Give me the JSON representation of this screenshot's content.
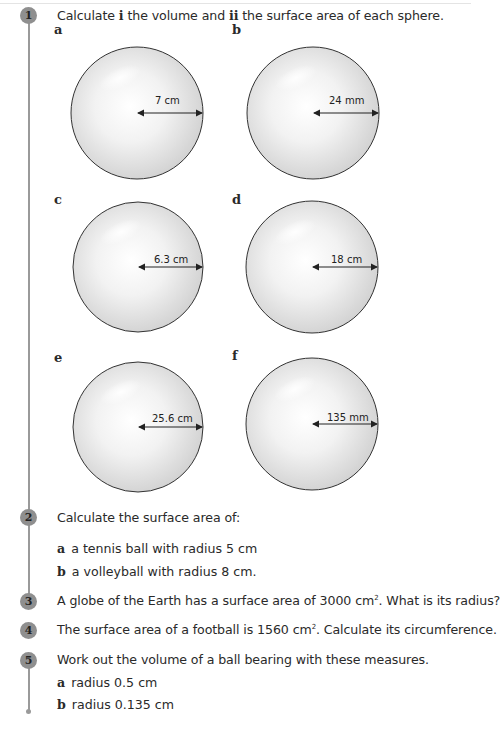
{
  "questions": [
    {
      "number": "1",
      "text_parts": [
        "Calculate ",
        "i",
        " the volume and ",
        "ii",
        " the surface area of each sphere."
      ],
      "spheres": [
        {
          "label": "a",
          "radius": "7 cm"
        },
        {
          "label": "b",
          "radius": "24 mm"
        },
        {
          "label": "c",
          "radius": "6.3 cm"
        },
        {
          "label": "d",
          "radius": "18 cm"
        },
        {
          "label": "e",
          "radius": "25.6 cm"
        },
        {
          "label": "f",
          "radius": "135 mm"
        }
      ]
    },
    {
      "number": "2",
      "text": "Calculate the surface area of:",
      "parts": [
        {
          "label": "a",
          "text": "a tennis ball with radius 5 cm"
        },
        {
          "label": "b",
          "text": "a volleyball with radius 8 cm."
        }
      ]
    },
    {
      "number": "3",
      "text_before": "A globe of the Earth has a surface area of 3000 cm",
      "sup": "2",
      "text_after": ". What is its radius?"
    },
    {
      "number": "4",
      "text_before": "The surface area of a football is 1560 cm",
      "sup": "2",
      "text_after": ". Calculate its circumference."
    },
    {
      "number": "5",
      "text": "Work out the volume of a ball bearing with these measures.",
      "parts": [
        {
          "label": "a",
          "text": "radius 0.5 cm"
        },
        {
          "label": "b",
          "text": "radius 0.135 cm"
        }
      ]
    }
  ],
  "colors": {
    "badge": "#8f8f8f",
    "line": "#9a9a9a",
    "sphere_edge": "#333333",
    "sphere_fill": "#d8d8d8"
  }
}
